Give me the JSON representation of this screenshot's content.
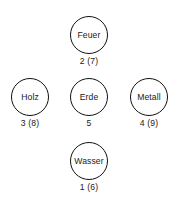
{
  "diagram": {
    "type": "wu-xing-five-elements-cross",
    "language": "de",
    "background_color": "#ffffff",
    "stroke_color": "#111111",
    "text_color": "#1a1a1a",
    "nodes": [
      {
        "id": "feuer",
        "label": "Feuer",
        "caption": "2 (7)",
        "position": "top-center",
        "number": 2,
        "alternate_number": 7
      },
      {
        "id": "holz",
        "label": "Holz",
        "caption": "3 (8)",
        "position": "middle-left",
        "number": 3,
        "alternate_number": 8
      },
      {
        "id": "erde",
        "label": "Erde",
        "caption": "5",
        "position": "middle-center",
        "number": 5,
        "alternate_number": null
      },
      {
        "id": "metall",
        "label": "Metall",
        "caption": "4 (9)",
        "position": "middle-right",
        "number": 4,
        "alternate_number": 9
      },
      {
        "id": "wasser",
        "label": "Wasser",
        "caption": "1 (6)",
        "position": "bottom-center",
        "number": 1,
        "alternate_number": 6
      }
    ]
  }
}
